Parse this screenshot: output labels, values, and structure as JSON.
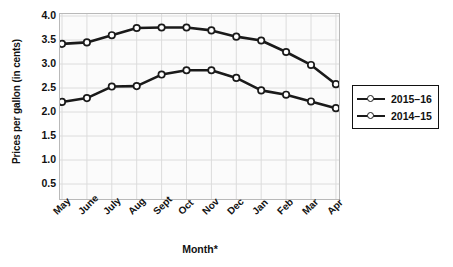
{
  "chart_data": {
    "type": "line",
    "title": "",
    "xlabel": "Month*",
    "ylabel": "Prices per gallon (in cents)",
    "categories": [
      "May",
      "June",
      "July",
      "Aug",
      "Sept",
      "Oct",
      "Nov",
      "Dec",
      "Jan",
      "Feb",
      "Mar",
      "Apr"
    ],
    "ylim": [
      0.0,
      4.0
    ],
    "yticks": [
      "4.0",
      "3.5",
      "3.0",
      "2.5",
      "2.0",
      "1.5",
      "1.0",
      "0.5"
    ],
    "ytick_values": [
      4.0,
      3.5,
      3.0,
      2.5,
      2.0,
      1.5,
      1.0,
      0.5
    ],
    "grid": true,
    "legend_position": "right",
    "series": [
      {
        "name": "2015–16",
        "values": [
          2.21,
          2.29,
          2.53,
          2.54,
          2.78,
          2.87,
          2.87,
          2.71,
          2.45,
          2.36,
          2.22,
          2.08
        ]
      },
      {
        "name": "2014–15",
        "values": [
          3.42,
          3.45,
          3.6,
          3.75,
          3.76,
          3.76,
          3.7,
          3.57,
          3.49,
          3.25,
          2.98,
          2.58
        ]
      }
    ]
  },
  "legend": {
    "entries": [
      {
        "label": "2015–16"
      },
      {
        "label": "2014–15"
      }
    ]
  },
  "axes": {
    "y_title": "Prices per gallon (in cents)",
    "x_title": "Month*"
  }
}
